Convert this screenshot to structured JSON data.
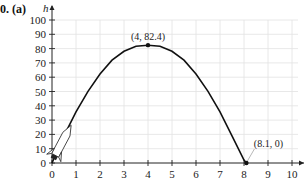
{
  "figure_label": "0. (a)",
  "chart_data": {
    "type": "line",
    "title": "",
    "xlabel": "",
    "ylabel": "h",
    "xlim": [
      0,
      10
    ],
    "ylim": [
      0,
      100
    ],
    "x_ticks": [
      "0",
      "1",
      "2",
      "3",
      "4",
      "5",
      "6",
      "7",
      "8",
      "9",
      "10"
    ],
    "y_ticks": [
      "0",
      "10",
      "20",
      "30",
      "40",
      "50",
      "60",
      "70",
      "80",
      "90",
      "100"
    ],
    "grid": true,
    "series": [
      {
        "name": "trajectory",
        "x": [
          0,
          0.5,
          1,
          1.5,
          2,
          2.5,
          3,
          3.5,
          4,
          4.5,
          5,
          5.5,
          6,
          6.5,
          7,
          7.5,
          8,
          8.1
        ],
        "values": [
          0,
          19.0,
          35.7,
          50.1,
          62.2,
          71.9,
          78.1,
          81.6,
          82.4,
          81.6,
          78.1,
          71.9,
          62.2,
          50.1,
          35.7,
          19.0,
          2.0,
          0
        ]
      }
    ],
    "annotations": [
      {
        "text": "(4, 82.4)",
        "x": 4,
        "y": 82.4
      },
      {
        "text": "(8.1, 0)",
        "x": 8.1,
        "y": 0
      }
    ],
    "decorations": [
      "rocket-icon at origin"
    ]
  }
}
